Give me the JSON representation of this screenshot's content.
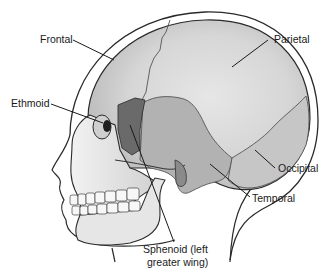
{
  "diagram": {
    "type": "anatomical-illustration",
    "labels": {
      "frontal": "Frontal",
      "parietal": "Parietal",
      "ethmoid": "Ethmoid",
      "occipital": "Occipital",
      "temporal": "Temporal",
      "sphenoid_line1": "Sphenoid (left",
      "sphenoid_line2": "greater wing)"
    },
    "colors": {
      "outline": "#2a2a2a",
      "frontal": "#d9d9d9",
      "parietal": "#dcdcdc",
      "temporal": "#b4b4b4",
      "sphenoid": "#6e6e6e",
      "occipital": "#c8c8c8",
      "face": "#ececec",
      "orbit": "#1e1e1e"
    }
  }
}
